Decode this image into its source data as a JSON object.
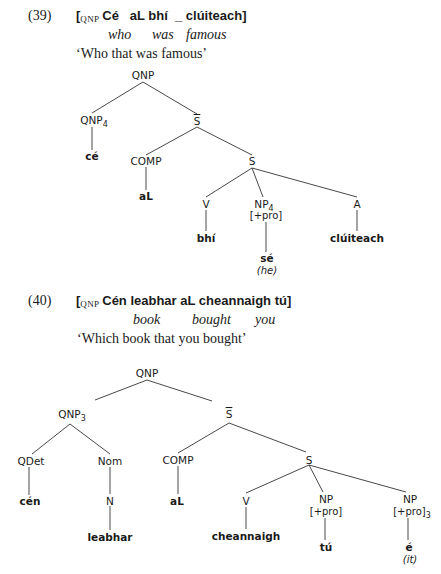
{
  "examples": [
    {
      "number": "(39)",
      "bracket_label": "QNP",
      "irish": "Cé   aL bhí  _ clúiteach]",
      "gloss": [
        "who",
        "was",
        "famous"
      ],
      "translation": "‘Who that was famous’",
      "tree": {
        "root": "QNP",
        "nodes": {
          "qnp4": {
            "label": "QNP",
            "index": "4"
          },
          "sbar": {
            "label": "S"
          },
          "ce": {
            "label": "cé"
          },
          "comp": {
            "label": "COMP"
          },
          "s": {
            "label": "S"
          },
          "al": {
            "label": "aL"
          },
          "v": {
            "label": "V"
          },
          "np4": {
            "label": "NP",
            "index": "4",
            "feature": "[+pro]"
          },
          "a": {
            "label": "A"
          },
          "bhi": {
            "label": "bhí"
          },
          "se": {
            "label": "sé",
            "gloss": "(he)"
          },
          "cluiteach": {
            "label": "clúiteach"
          }
        }
      }
    },
    {
      "number": "(40)",
      "bracket_label": "QNP",
      "irish": "Cén leabhar aL cheannaigh tú]",
      "gloss": [
        "book",
        "bought",
        "you"
      ],
      "translation": "‘Which book that you bought’",
      "tree": {
        "root": "QNP",
        "nodes": {
          "qnp3": {
            "label": "QNP",
            "index": "3"
          },
          "sbar": {
            "label": "S"
          },
          "qdet": {
            "label": "QDet"
          },
          "nom": {
            "label": "Nom"
          },
          "comp": {
            "label": "COMP"
          },
          "s": {
            "label": "S"
          },
          "cen": {
            "label": "cén"
          },
          "n": {
            "label": "N"
          },
          "al": {
            "label": "aL"
          },
          "v": {
            "label": "V"
          },
          "np_a": {
            "label": "NP",
            "feature": "[+pro]"
          },
          "np_b": {
            "label": "NP",
            "feature": "[+pro]",
            "index": "3"
          },
          "leabhar": {
            "label": "leabhar"
          },
          "cheannaigh": {
            "label": "cheannaigh"
          },
          "tu": {
            "label": "tú"
          },
          "e": {
            "label": "é",
            "gloss": "(it)"
          }
        }
      }
    }
  ]
}
